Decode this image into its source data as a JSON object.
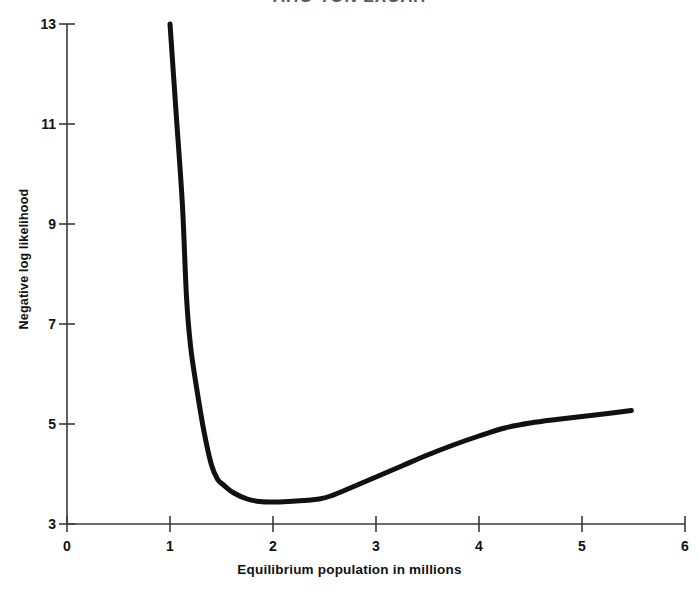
{
  "figure": {
    "title_clipped": "ΑΠΟ ΤΟΝ ΣΧΟΛΗ",
    "background_color": "#ffffff",
    "line_color": "#111111",
    "axis_color": "#3a3a3a",
    "width": 699,
    "height": 592
  },
  "chart_data": {
    "type": "line",
    "title": "",
    "xlabel": "Equilibrium population in millions",
    "ylabel": "Negative log likelihood",
    "xlim": [
      0,
      6
    ],
    "ylim": [
      3,
      13
    ],
    "xticks": [
      0,
      1,
      2,
      3,
      4,
      5,
      6
    ],
    "xtick_labels": [
      "0",
      "1",
      "2",
      "3",
      "4",
      "5",
      "6"
    ],
    "yticks": [
      3,
      5,
      7,
      9,
      11,
      13
    ],
    "ytick_labels": [
      "3",
      "5",
      "7",
      "9",
      "11",
      "13"
    ],
    "grid": false,
    "legend": null,
    "series": [
      {
        "name": "negative log likelihood",
        "line_width": 5,
        "color": "#111111",
        "points": [
          [
            1.0,
            13.0
          ],
          [
            1.06,
            11.2
          ],
          [
            1.12,
            9.4
          ],
          [
            1.16,
            7.55
          ],
          [
            1.2,
            6.55
          ],
          [
            1.26,
            5.7
          ],
          [
            1.33,
            4.85
          ],
          [
            1.4,
            4.2
          ],
          [
            1.46,
            3.9
          ],
          [
            1.52,
            3.78
          ],
          [
            1.62,
            3.62
          ],
          [
            1.75,
            3.5
          ],
          [
            1.87,
            3.45
          ],
          [
            2.0,
            3.44
          ],
          [
            2.15,
            3.45
          ],
          [
            2.3,
            3.47
          ],
          [
            2.45,
            3.5
          ],
          [
            2.56,
            3.56
          ],
          [
            2.75,
            3.72
          ],
          [
            3.0,
            3.94
          ],
          [
            3.25,
            4.16
          ],
          [
            3.5,
            4.38
          ],
          [
            3.75,
            4.58
          ],
          [
            4.0,
            4.76
          ],
          [
            4.25,
            4.92
          ],
          [
            4.5,
            5.02
          ],
          [
            4.75,
            5.09
          ],
          [
            5.0,
            5.15
          ],
          [
            5.25,
            5.21
          ],
          [
            5.48,
            5.27
          ]
        ]
      }
    ],
    "minimum": {
      "x": 2.0,
      "y": 3.44
    }
  },
  "axis_titles": {
    "x": "Equilibrium population in millions",
    "y": "Negative log likelihood"
  }
}
